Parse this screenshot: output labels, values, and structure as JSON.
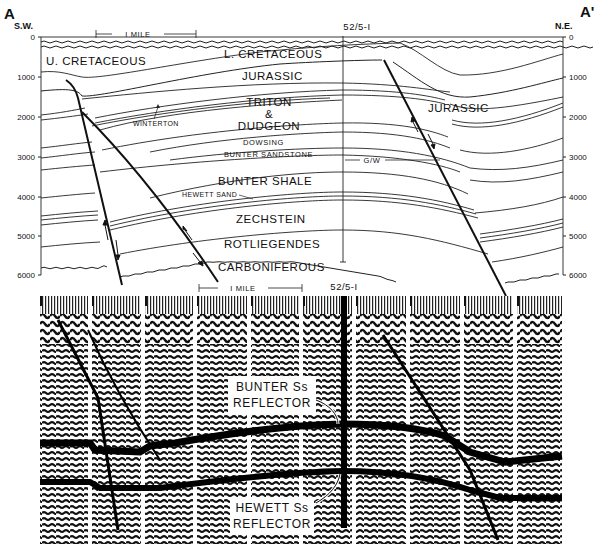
{
  "cross_section": {
    "left_end": {
      "letter": "A",
      "direction": "S.W."
    },
    "right_end": {
      "letter": "A'",
      "direction": "N.E."
    },
    "scale_bar": "I MILE",
    "well_label": "52/5-I",
    "depth_axis": {
      "left_ticks": [
        "0",
        "1000",
        "2000",
        "3000",
        "4000",
        "5000",
        "6000"
      ],
      "right_ticks": [
        "0",
        "1000",
        "2000",
        "3000",
        "4000",
        "5000",
        "6000"
      ]
    },
    "formations": {
      "u_cretaceous": "U. CRETACEOUS",
      "l_cretaceous": "L. CRETACEOUS",
      "jurassic_center": "JURASSIC",
      "jurassic_right": "JURASSIC",
      "triton_1": "TRITON",
      "triton_2": "&",
      "triton_3": "DUDGEON",
      "winterton": "WINTERTON",
      "dowsing": "DOWSING",
      "bunter_sandstone": "BUNTER SANDSTONE",
      "gas_water": "G/W",
      "bunter_shale": "BUNTER SHALE",
      "hewett_sand": "HEWETT SAND",
      "zechstein": "ZECHSTEIN",
      "rotliegendes": "ROTLIEGENDES",
      "carboniferous": "CARBONIFEROUS"
    }
  },
  "seismic_section": {
    "scale_bar": "I MILE",
    "well_label": "52/5-I",
    "bunter_callout": {
      "line1": "BUNTER Ss",
      "line2": "REFLECTOR"
    },
    "hewett_callout": {
      "line1": "HEWETT Ss",
      "line2": "REFLECTOR"
    }
  }
}
